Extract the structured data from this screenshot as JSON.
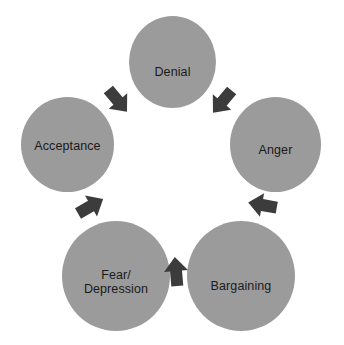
{
  "diagram": {
    "type": "cycle-diagram",
    "background_color": "#ffffff",
    "node_color": "#9b9b9b",
    "arrow_color": "#3c3c3c",
    "label_color": "#1a1a1a",
    "direction": "clockwise",
    "nodes": [
      {
        "id": "denial",
        "label": "Denial"
      },
      {
        "id": "anger",
        "label": "Anger"
      },
      {
        "id": "bargaining",
        "label": "Bargaining"
      },
      {
        "id": "fear",
        "label": "Fear/\nDepression"
      },
      {
        "id": "acceptance",
        "label": "Acceptance"
      }
    ],
    "arrows": [
      {
        "id": "acceptance-denial",
        "from": "Acceptance",
        "to": "Denial"
      },
      {
        "id": "denial-anger",
        "from": "Denial",
        "to": "Anger"
      },
      {
        "id": "anger-bargaining",
        "from": "Anger",
        "to": "Bargaining"
      },
      {
        "id": "bargaining-fear",
        "from": "Bargaining",
        "to": "Fear/Depression"
      },
      {
        "id": "fear-acceptance",
        "from": "Fear/Depression",
        "to": "Acceptance"
      }
    ]
  }
}
